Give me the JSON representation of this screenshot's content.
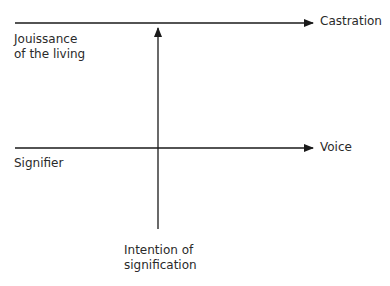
{
  "diagram": {
    "type": "graph-of-desire-elementary-cell",
    "top_line": {
      "left_label": [
        "Jouissance",
        "of the living"
      ],
      "right_label": "Castration"
    },
    "middle_line": {
      "left_label": "Signifier",
      "right_label": "Voice"
    },
    "vertical_line": {
      "bottom_label": [
        "Intention of",
        "signification"
      ]
    },
    "colors": {
      "line": "#1a1a1a",
      "text": "#2a2a2a",
      "background": "#ffffff"
    }
  }
}
